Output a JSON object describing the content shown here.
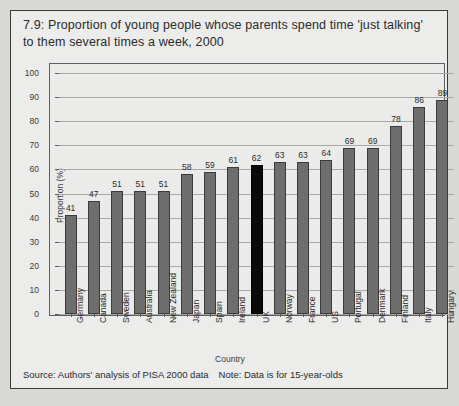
{
  "figure": {
    "title": "7.9: Proportion of young people whose parents spend time 'just talking' to them several times a week, 2000",
    "source": "Source: Authors' analysis of PISA 2000 data",
    "note": "Note: Data is for 15-year-olds",
    "bar_color": "#6e6e6e",
    "highlight_color": "#0a0a0a",
    "background": "#ececeb"
  },
  "chart_data": {
    "type": "bar",
    "title": "7.9: Proportion of young people whose parents spend time 'just talking' to them several times a week, 2000",
    "xlabel": "Country",
    "ylabel": "Proportion (%)",
    "ylim": [
      0,
      100
    ],
    "yticks": [
      0,
      10,
      20,
      30,
      40,
      50,
      60,
      70,
      80,
      90,
      100
    ],
    "grid": true,
    "legend": "none",
    "highlight_category": "UK",
    "categories": [
      "Germany",
      "Canada",
      "Sweden",
      "Australia",
      "New Zealand",
      "Japan",
      "Spain",
      "Ireland",
      "UK",
      "Norway",
      "France",
      "US",
      "Portugal",
      "Denmark",
      "Finland",
      "Italy",
      "Hungary"
    ],
    "values": [
      41,
      47,
      51,
      51,
      51,
      58,
      59,
      61,
      62,
      63,
      63,
      64,
      69,
      69,
      78,
      86,
      89
    ]
  }
}
